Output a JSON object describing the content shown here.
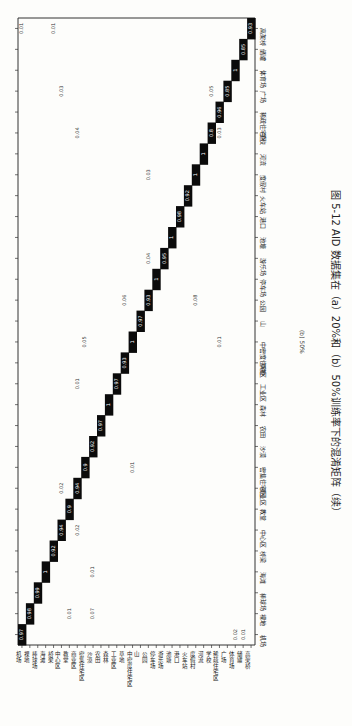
{
  "caption": {
    "figure_label": "图 5-12",
    "text": "AID 数据集在（a）20%和（b）50%训练率下的混淆矩阵（续）",
    "sublabel": "(b) 50%"
  },
  "chart_data": {
    "type": "heatmap",
    "xlabel": "",
    "ylabel": "",
    "orientation_note": "page rotated 90° clockwise",
    "classes": [
      "机场",
      "裸地",
      "棒球场",
      "海滩",
      "桥梁",
      "中心区",
      "教堂",
      "商业区",
      "密集住宅区",
      "沙漠",
      "农田",
      "森林",
      "工业区",
      "草地",
      "中密度住宅区",
      "山",
      "公园",
      "停车场",
      "游乐场",
      "池塘",
      "港口",
      "火车站",
      "度假村",
      "河流",
      "学校",
      "稀疏住宅区",
      "广场",
      "体育场",
      "储罐",
      "高架桥"
    ],
    "diagonal": [
      0.97,
      0.98,
      0.99,
      1,
      0.92,
      0.94,
      0.9,
      0.94,
      0.9,
      0.92,
      0.97,
      1,
      0.97,
      0.93,
      1,
      0.97,
      0.93,
      1,
      0.95,
      1,
      0.98,
      0.92,
      1,
      1,
      0.8,
      0.96,
      0.85,
      1,
      0.85,
      0.93
    ],
    "off_diagonal": [
      {
        "row": "裸地",
        "col": "沙漠",
        "value": 0.07
      },
      {
        "row": "裸地",
        "col": "教堂",
        "value": 0.01
      },
      {
        "row": "海滩",
        "col": "沙漠",
        "value": 0.01
      },
      {
        "row": "中心区",
        "col": "商业区",
        "value": 0.02
      },
      {
        "row": "商业区",
        "col": "中心区",
        "value": 0.02
      },
      {
        "row": "密集住宅区",
        "col": "中密度住宅区",
        "value": 0.01
      },
      {
        "row": "中密度住宅区",
        "col": "密集住宅区",
        "value": 0.05
      },
      {
        "row": "中密度住宅区",
        "col": "稀疏住宅区",
        "value": 0.01
      },
      {
        "row": "工业区",
        "col": "商业区",
        "value": 0.01
      },
      {
        "row": "公园",
        "col": "草地",
        "value": 0.06
      },
      {
        "row": "公园",
        "col": "度假村",
        "value": 0.08
      },
      {
        "row": "游乐场",
        "col": "公园",
        "value": 0.04
      },
      {
        "row": "度假村",
        "col": "公园",
        "value": 0.03
      },
      {
        "row": "学校",
        "col": "商业区",
        "value": 0.04
      },
      {
        "row": "学校",
        "col": "稀疏住宅区",
        "value": 0.03
      },
      {
        "row": "广场",
        "col": "学校",
        "value": 0.05
      },
      {
        "row": "广场",
        "col": "中心区",
        "value": 0.03
      },
      {
        "row": "高架桥",
        "col": "机场",
        "value": 0.01
      },
      {
        "row": "高架桥",
        "col": "桥梁",
        "value": 0.01
      },
      {
        "row": "机场",
        "col": "体育场",
        "value": 0.02
      },
      {
        "row": "机场",
        "col": "储罐",
        "value": 0.01
      }
    ],
    "grid": false,
    "colormap": "binary (black = high)",
    "value_range": [
      0,
      1
    ]
  }
}
